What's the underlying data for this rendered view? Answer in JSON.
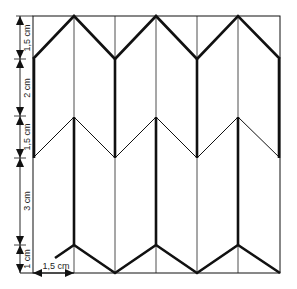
{
  "diagram": {
    "type": "folding-pattern",
    "frame": {
      "x0": 33,
      "x1": 280,
      "y0": 16,
      "y1": 273
    },
    "columns_x": [
      33,
      74,
      115,
      156,
      197,
      238,
      280
    ],
    "stroke_color": "#111111",
    "background": "#ffffff"
  },
  "dimensions": {
    "vertical": [
      {
        "label": "1,5 cm",
        "from_y": 16,
        "to_y": 59
      },
      {
        "label": "2 cm",
        "from_y": 59,
        "to_y": 116
      },
      {
        "label": "1,5 cm",
        "from_y": 116,
        "to_y": 158
      },
      {
        "label": "3 cm",
        "from_y": 158,
        "to_y": 245
      },
      {
        "label": "1 cm",
        "from_y": 245,
        "to_y": 273
      }
    ],
    "horizontal": [
      {
        "label": "1,5 cm",
        "from_x": 33,
        "to_x": 74,
        "y": 273
      }
    ]
  }
}
